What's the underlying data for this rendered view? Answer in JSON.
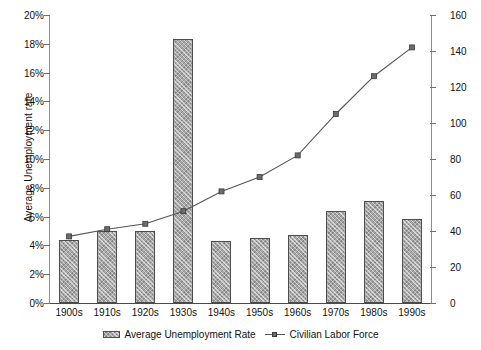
{
  "chart_data": {
    "type": "bar",
    "title": "",
    "categories": [
      "1900s",
      "1910s",
      "1920s",
      "1930s",
      "1940s",
      "1950s",
      "1960s",
      "1970s",
      "1980s",
      "1990s"
    ],
    "xlabel": "",
    "grid": false,
    "legend_position": "bottom",
    "series": [
      {
        "name": "Average Unemployment Rate",
        "type": "bar",
        "axis": "left",
        "unit": "%",
        "values": [
          4.4,
          5.0,
          5.0,
          18.3,
          4.3,
          4.5,
          4.7,
          6.4,
          7.1,
          5.8
        ]
      },
      {
        "name": "Civilian Labor Force",
        "type": "line",
        "axis": "right",
        "unit": "millions",
        "values": [
          37,
          41,
          44,
          51,
          62,
          70,
          82,
          105,
          126,
          142
        ]
      }
    ],
    "axes": {
      "left": {
        "label": "Average Unemployment rate",
        "min": 0,
        "max": 20,
        "step": 2,
        "ticks": [
          "0%",
          "2%",
          "4%",
          "6%",
          "8%",
          "10%",
          "12%",
          "14%",
          "16%",
          "18%",
          "20%"
        ]
      },
      "right": {
        "label": "Civilian Labor Fource (at end of decade) (in millions)",
        "min": 0,
        "max": 160,
        "step": 20,
        "ticks": [
          "0",
          "20",
          "40",
          "60",
          "80",
          "100",
          "120",
          "140",
          "160"
        ]
      }
    },
    "colors": {
      "bar_fill": "#a8a8a8",
      "bar_border": "#4d4d4d",
      "line": "#555555",
      "marker": "#6b6b6b",
      "axis": "#6f6f6f",
      "text": "#111111"
    }
  },
  "legend": {
    "items": [
      {
        "label": "Average Unemployment Rate",
        "marker": "bar-swatch-icon"
      },
      {
        "label": "Civilian Labor Force",
        "marker": "line-marker-icon"
      }
    ]
  }
}
